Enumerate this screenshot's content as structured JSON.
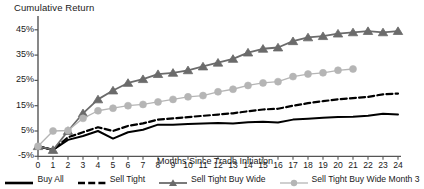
{
  "chart_data": {
    "type": "line",
    "title": "Cumulative Return",
    "xlabel": "Months Since Trade Initiation",
    "ylabel": "Cumulative Return",
    "grid": false,
    "legend_position": "bottom",
    "xlim": [
      0,
      24
    ],
    "ylim": [
      -5,
      50
    ],
    "x": [
      0,
      1,
      2,
      3,
      4,
      5,
      6,
      7,
      8,
      9,
      10,
      11,
      12,
      13,
      14,
      15,
      16,
      17,
      18,
      19,
      20,
      21,
      22,
      23,
      24
    ],
    "xticklabels": [
      "0",
      "1",
      "2",
      "3",
      "4",
      "5",
      "6",
      "7",
      "8",
      "9",
      "10",
      "11",
      "12",
      "13",
      "14",
      "15",
      "16",
      "17",
      "18",
      "19",
      "20",
      "21",
      "22",
      "23",
      "24"
    ],
    "yticklabels": [
      "-5%",
      "5%",
      "15%",
      "25%",
      "35%",
      "45%"
    ],
    "yticks": [
      -5,
      5,
      15,
      25,
      35,
      45
    ],
    "series": [
      {
        "name": "Buy All",
        "marker": "none",
        "line": "solid",
        "color": "#000000",
        "values": [
          -1.0,
          -2.5,
          1.5,
          3.0,
          5.0,
          2.0,
          4.5,
          5.5,
          7.5,
          7.5,
          7.8,
          8.0,
          8.2,
          8.0,
          8.5,
          8.7,
          8.4,
          9.5,
          9.8,
          10.2,
          10.5,
          10.6,
          11.0,
          11.8,
          11.5
        ]
      },
      {
        "name": "Sell Tight",
        "marker": "none",
        "line": "dashed",
        "color": "#000000",
        "values": [
          -1.0,
          -2.5,
          2.5,
          4.5,
          6.5,
          5.0,
          7.0,
          8.0,
          9.5,
          10.0,
          10.5,
          11.0,
          11.5,
          12.0,
          12.8,
          13.5,
          13.8,
          15.0,
          16.0,
          16.8,
          17.5,
          18.0,
          18.5,
          19.5,
          19.8
        ]
      },
      {
        "name": "Sell Tight Buy Wide",
        "marker": "triangle",
        "line": "solid",
        "color": "#6b6b6b",
        "values": [
          -1.0,
          -2.5,
          5.0,
          12.0,
          17.5,
          21.0,
          24.0,
          25.5,
          27.5,
          28.0,
          29.0,
          30.5,
          32.0,
          33.5,
          36.0,
          37.5,
          38.0,
          40.5,
          42.0,
          42.5,
          43.5,
          44.0,
          44.5,
          44.0,
          44.5
        ]
      },
      {
        "name": "Sell Tight Buy Wide Month 3",
        "marker": "circle",
        "line": "solid",
        "color": "#b5b5b5",
        "values": [
          -1.0,
          5.0,
          5.2,
          10.0,
          13.0,
          14.0,
          15.0,
          15.5,
          16.5,
          17.5,
          18.5,
          19.0,
          20.5,
          21.5,
          23.0,
          24.0,
          24.5,
          26.5,
          27.5,
          28.0,
          29.0,
          29.5,
          null,
          null,
          null
        ]
      }
    ]
  },
  "legend": {
    "items": [
      {
        "label": "Buy All"
      },
      {
        "label": "Sell Tight"
      },
      {
        "label": "Sell Tight Buy Wide"
      },
      {
        "label": "Sell Tight Buy Wide Month 3"
      }
    ]
  }
}
